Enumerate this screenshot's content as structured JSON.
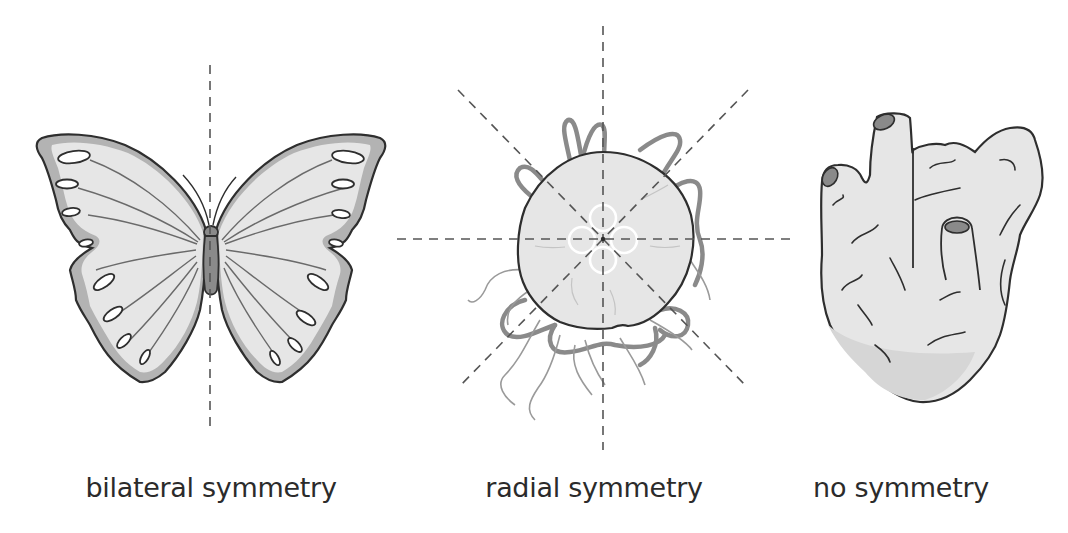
{
  "figure": {
    "panels": [
      {
        "id": "bilateral",
        "organism": "butterfly",
        "label": "bilateral symmetry",
        "symmetry_axes": 1
      },
      {
        "id": "radial",
        "organism": "jellyfish",
        "label": "radial symmetry",
        "symmetry_axes": 4
      },
      {
        "id": "none",
        "organism": "sponge",
        "label": "no symmetry",
        "symmetry_axes": 0
      }
    ]
  },
  "colors": {
    "background": "#ffffff",
    "fill_light": "#e6e6e6",
    "fill_mid": "#b3b3b3",
    "fill_dark": "#8a8a8a",
    "outline": "#2e2e2e",
    "axis_dash": "#555555",
    "text": "#2b2b2b"
  }
}
